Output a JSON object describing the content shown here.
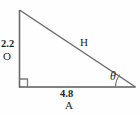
{
  "figure": {
    "type": "right-triangle-trigonometry-diagram",
    "background_color": "#fefefe",
    "stroke_color": "#6a6a6a",
    "base_stroke_color": "#5a5a5a",
    "text_color": "#1e1e1e",
    "labels": {
      "opposite_value": "2.2",
      "opposite_name": "O",
      "adjacent_value": "4.8",
      "adjacent_name": "A",
      "hypotenuse_name": "H",
      "angle_symbol": "θ"
    },
    "geometry": {
      "apex": {
        "x": 19,
        "y": 10
      },
      "right_angle_vertex": {
        "x": 19,
        "y": 87
      },
      "angle_vertex": {
        "x": 135,
        "y": 87
      },
      "right_angle_marker_size": 8,
      "angle_arc_radius": 20
    }
  }
}
